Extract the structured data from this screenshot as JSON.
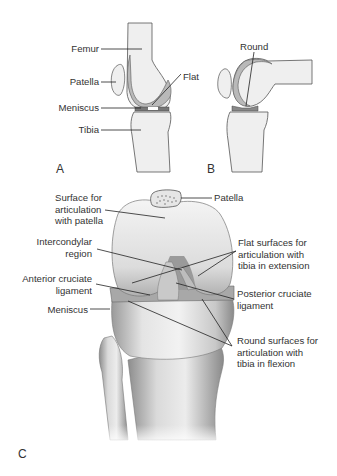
{
  "figure": {
    "panels": [
      {
        "id": "A",
        "label": "A",
        "description": "Lateral knee in extension"
      },
      {
        "id": "B",
        "label": "B",
        "description": "Lateral knee in flexion"
      },
      {
        "id": "C",
        "label": "C",
        "description": "Anterior view of flexed knee joint"
      }
    ],
    "panelA": {
      "labels": {
        "femur": "Femur",
        "patella": "Patella",
        "meniscus": "Meniscus",
        "tibia": "Tibia",
        "flat": "Flat"
      }
    },
    "panelB": {
      "labels": {
        "round": "Round"
      }
    },
    "panelC": {
      "labels": {
        "patella": "Patella",
        "surface_patella": "Surface for\narticulation\nwith patella",
        "intercondylar": "Intercondylar\nregion",
        "acl": "Anterior cruciate\nligament",
        "meniscus": "Meniscus",
        "flat_surfaces": "Flat surfaces for\narticulation with\ntibia in extension",
        "pcl": "Posterior cruciate\nligament",
        "round_surfaces": "Round surfaces for\narticulation with\ntibia in flexion"
      }
    },
    "colors": {
      "bone_fill": "#efefef",
      "cartilage": "#b9b9b9",
      "outline": "#555555",
      "leader_line": "#222222",
      "text": "#333333"
    }
  }
}
